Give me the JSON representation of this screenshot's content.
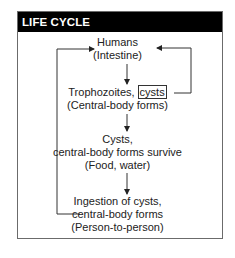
{
  "title": "LIFE CYCLE",
  "nodes": [
    {
      "id": "humans",
      "lines": [
        "Humans",
        "(Intestine)"
      ]
    },
    {
      "id": "trophozoites",
      "line1_prefix": "Trophozoites, ",
      "line1_boxed": "cysts",
      "lines": [
        "(Central-body forms)"
      ]
    },
    {
      "id": "cysts",
      "lines": [
        "Cysts,",
        "central-body forms survive",
        "(Food, water)"
      ]
    },
    {
      "id": "ingestion",
      "lines": [
        "Ingestion of cysts,",
        "central-body forms",
        "(Person-to-person)"
      ]
    }
  ],
  "edges": [
    {
      "from": "humans",
      "to": "trophozoites",
      "type": "down-arrow"
    },
    {
      "from": "trophozoites",
      "to": "cysts",
      "type": "down-arrow"
    },
    {
      "from": "cysts",
      "to": "ingestion",
      "type": "down-arrow"
    },
    {
      "from": "ingestion",
      "to": "humans",
      "type": "left-loop-arrow"
    },
    {
      "from": "trophozoites.cysts",
      "to": "humans",
      "type": "right-loop-arrow"
    }
  ],
  "colors": {
    "header_bg": "#000000",
    "header_text": "#ffffff",
    "border": "#6b6b6b",
    "line": "#333333"
  }
}
